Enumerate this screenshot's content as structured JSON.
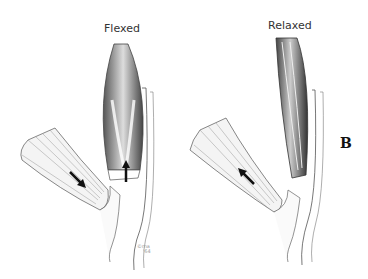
{
  "figure": {
    "panel_letter": "B",
    "left_panel": {
      "title": "Flexed",
      "arrow_tendon": "down-right",
      "arrow_muscle": "up"
    },
    "right_panel": {
      "title": "Relaxed",
      "arrow_tendon": "up-left"
    },
    "credit": {
      "symbol": "©",
      "line1": "ma",
      "line2": "'64"
    }
  }
}
